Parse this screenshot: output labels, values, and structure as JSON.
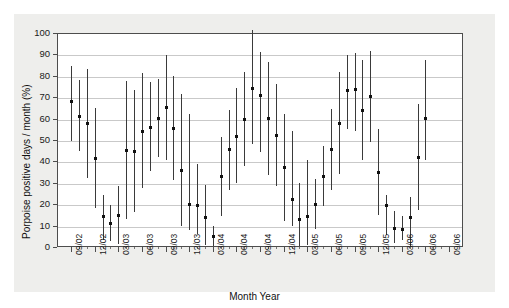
{
  "chart_data": {
    "type": "scatter",
    "title": "",
    "xlabel": "Month Year",
    "ylabel": "Porpoise positive days / month (%)",
    "ylim": [
      0,
      100
    ],
    "yticks": [
      0,
      10,
      20,
      30,
      40,
      50,
      60,
      70,
      80,
      90,
      100
    ],
    "grid": true,
    "legend": null,
    "xtick_labels": [
      "09/02",
      "12/02",
      "03/03",
      "06/03",
      "09/03",
      "12/03",
      "03/04",
      "06/04",
      "09/04",
      "12/04",
      "03/05",
      "06/05",
      "09/05",
      "12/05",
      "03/06",
      "06/06",
      "09/06"
    ],
    "x_axis_note": "Monthly points; tick labels every 3 months from 09/02 to 09/06",
    "series_note": "Mean porpoise positive days per month with vertical range (min-max) bars",
    "points": [
      {
        "x": "09/02",
        "mean": 68.0,
        "low": 49.5,
        "high": 84.8
      },
      {
        "x": "10/02",
        "mean": 61.4,
        "low": 45.0,
        "high": 78.0
      },
      {
        "x": "11/02",
        "mean": 57.8,
        "low": 32.3,
        "high": 83.2
      },
      {
        "x": "12/02",
        "mean": 41.6,
        "low": 18.2,
        "high": 65.0
      },
      {
        "x": "01/03",
        "mean": 14.3,
        "low": 3.5,
        "high": 24.2
      },
      {
        "x": "02/03",
        "mean": 11.2,
        "low": 3.0,
        "high": 19.4
      },
      {
        "x": "03/03",
        "mean": 14.8,
        "low": 1.5,
        "high": 28.5
      },
      {
        "x": "04/03",
        "mean": 45.2,
        "low": 13.0,
        "high": 77.4
      },
      {
        "x": "05/03",
        "mean": 44.8,
        "low": 16.3,
        "high": 73.5
      },
      {
        "x": "06/03",
        "mean": 54.3,
        "low": 27.5,
        "high": 81.3
      },
      {
        "x": "07/03",
        "mean": 56.2,
        "low": 35.5,
        "high": 76.9
      },
      {
        "x": "08/03",
        "mean": 60.4,
        "low": 42.0,
        "high": 78.7
      },
      {
        "x": "09/03",
        "mean": 65.3,
        "low": 40.5,
        "high": 89.9
      },
      {
        "x": "10/03",
        "mean": 55.8,
        "low": 31.4,
        "high": 80.1
      },
      {
        "x": "11/03",
        "mean": 36.0,
        "low": 10.0,
        "high": 71.5
      },
      {
        "x": "12/03",
        "mean": 20.2,
        "low": 8.0,
        "high": 62.0
      },
      {
        "x": "01/04",
        "mean": 19.8,
        "low": 6.0,
        "high": 39.0
      },
      {
        "x": "02/04",
        "mean": 14.2,
        "low": 1.0,
        "high": 29.0
      },
      {
        "x": "03/04",
        "mean": 5.2,
        "low": 0.5,
        "high": 10.0
      },
      {
        "x": "04/04",
        "mean": 33.0,
        "low": 14.5,
        "high": 51.5
      },
      {
        "x": "05/04",
        "mean": 45.6,
        "low": 26.5,
        "high": 64.0
      },
      {
        "x": "06/04",
        "mean": 52.1,
        "low": 29.8,
        "high": 74.5
      },
      {
        "x": "07/04",
        "mean": 60.0,
        "low": 38.0,
        "high": 82.0
      },
      {
        "x": "08/04",
        "mean": 74.4,
        "low": 48.0,
        "high": 101.5
      },
      {
        "x": "09/04",
        "mean": 71.0,
        "low": 44.5,
        "high": 91.0
      },
      {
        "x": "10/04",
        "mean": 60.2,
        "low": 33.5,
        "high": 86.5
      },
      {
        "x": "11/04",
        "mean": 52.3,
        "low": 28.5,
        "high": 76.0
      },
      {
        "x": "12/04",
        "mean": 37.6,
        "low": 12.0,
        "high": 62.0
      },
      {
        "x": "01/05",
        "mean": 22.5,
        "low": 10.0,
        "high": 54.0
      },
      {
        "x": "02/05",
        "mean": 13.0,
        "low": 0.5,
        "high": 30.0
      },
      {
        "x": "03/05",
        "mean": 14.5,
        "low": 1.0,
        "high": 40.5
      },
      {
        "x": "04/05",
        "mean": 20.3,
        "low": 8.5,
        "high": 32.0
      },
      {
        "x": "05/05",
        "mean": 33.0,
        "low": 19.0,
        "high": 47.0
      },
      {
        "x": "06/05",
        "mean": 45.6,
        "low": 26.5,
        "high": 64.5
      },
      {
        "x": "07/05",
        "mean": 58.0,
        "low": 34.0,
        "high": 82.0
      },
      {
        "x": "08/05",
        "mean": 73.5,
        "low": 55.0,
        "high": 89.5
      },
      {
        "x": "09/05",
        "mean": 74.0,
        "low": 54.0,
        "high": 90.5
      },
      {
        "x": "10/05",
        "mean": 64.0,
        "low": 40.5,
        "high": 87.5
      },
      {
        "x": "11/05",
        "mean": 70.5,
        "low": 49.0,
        "high": 91.5
      },
      {
        "x": "12/05",
        "mean": 35.0,
        "low": 15.0,
        "high": 55.0
      },
      {
        "x": "01/06",
        "mean": 19.5,
        "low": 5.5,
        "high": 24.5
      },
      {
        "x": "02/06",
        "mean": 9.0,
        "low": 2.0,
        "high": 17.0
      },
      {
        "x": "03/06",
        "mean": 8.5,
        "low": 3.5,
        "high": 14.5
      },
      {
        "x": "04/06",
        "mean": 14.2,
        "low": 0.5,
        "high": 23.5
      },
      {
        "x": "05/06",
        "mean": 42.0,
        "low": 17.5,
        "high": 67.0
      },
      {
        "x": "06/06",
        "mean": 60.5,
        "low": 40.5,
        "high": 87.5
      }
    ]
  },
  "colors": {
    "panel_background": "#eeeeec",
    "plot_background": "#ffffff",
    "axis": "#4d4d4d",
    "grid": "#c9c9c9",
    "marker": "#111111",
    "errorbar": "#3a3a3a"
  }
}
